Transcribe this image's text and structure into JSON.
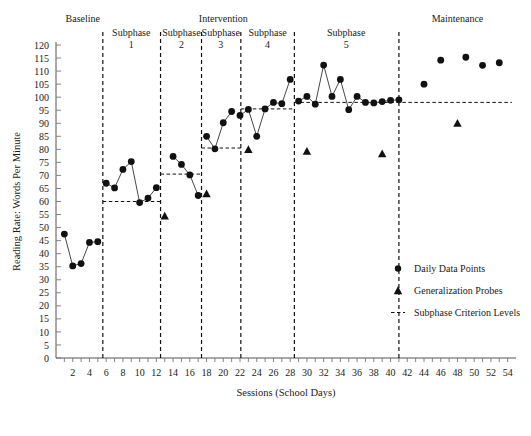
{
  "chart_data": {
    "type": "line",
    "title": "",
    "xlabel": "Sessions (School Days)",
    "ylabel": "Reading Rate: Words Per Minute",
    "xlim": [
      0,
      55
    ],
    "ylim": [
      0,
      120
    ],
    "ytick_step": 5,
    "yticks": [
      0,
      5,
      10,
      15,
      20,
      25,
      30,
      35,
      40,
      45,
      50,
      55,
      60,
      65,
      70,
      75,
      80,
      85,
      90,
      95,
      100,
      105,
      110,
      115,
      120
    ],
    "xticks": [
      2,
      4,
      6,
      8,
      10,
      12,
      14,
      16,
      18,
      20,
      22,
      24,
      26,
      28,
      30,
      32,
      34,
      36,
      38,
      40,
      42,
      44,
      46,
      48,
      50,
      52,
      54
    ],
    "grid": false,
    "legend_position": "inside-right",
    "series": [
      {
        "name": "Daily Data Points",
        "marker": "circle",
        "connected": true,
        "segments": [
          {
            "phase": "Baseline",
            "x": [
              1,
              2,
              3,
              4,
              5
            ],
            "y": [
              47.5,
              35.3,
              36.2,
              44.3,
              44.6
            ]
          },
          {
            "phase": "Subphase 1",
            "x": [
              6,
              7,
              8,
              9,
              10,
              11,
              12
            ],
            "y": [
              67.0,
              65.2,
              72.3,
              75.3,
              59.6,
              61.3,
              65.3
            ]
          },
          {
            "phase": "Subphase 2",
            "x": [
              14,
              15,
              16,
              17
            ],
            "y": [
              77.3,
              74.2,
              70.2,
              62.3
            ]
          },
          {
            "phase": "Subphase 3",
            "x": [
              18,
              19,
              20,
              21
            ],
            "y": [
              85.0,
              80.2,
              90.2,
              94.5
            ]
          },
          {
            "phase": "Subphase 4",
            "x": [
              22,
              23,
              24,
              25,
              26,
              27,
              28
            ],
            "y": [
              93.0,
              95.3,
              85.0,
              95.5,
              98.0,
              97.5,
              106.8
            ]
          },
          {
            "phase": "Subphase 5",
            "x": [
              29,
              30,
              31,
              32,
              33,
              34,
              35,
              36,
              37,
              38,
              39,
              40,
              41
            ],
            "y": [
              98.5,
              100.3,
              97.3,
              112.3,
              100.3,
              106.8,
              95.2,
              100.3,
              98.0,
              97.8,
              98.3,
              98.8,
              99.0
            ]
          },
          {
            "phase": "Maintenance",
            "x": [
              44,
              46,
              49,
              51,
              53
            ],
            "y": [
              105.0,
              114.2,
              115.3,
              112.2,
              113.2
            ],
            "connected": false
          }
        ]
      },
      {
        "name": "Generalization Probes",
        "marker": "triangle",
        "connected": false,
        "x": [
          13,
          18,
          23,
          30,
          39,
          48
        ],
        "y": [
          54.5,
          63.0,
          80.0,
          79.3,
          78.3,
          90.0
        ]
      }
    ],
    "criterion_levels": [
      {
        "phase": "Subphase 1",
        "value": 60.0,
        "x_start": 5.6,
        "x_end": 12.5
      },
      {
        "phase": "Subphase 2",
        "value": 70.5,
        "x_start": 12.5,
        "x_end": 17.4
      },
      {
        "phase": "Subphase 3",
        "value": 80.5,
        "x_start": 17.4,
        "x_end": 22.1
      },
      {
        "phase": "Subphase 4",
        "value": 95.5,
        "x_start": 22.1,
        "x_end": 28.5
      },
      {
        "phase": "Subphase 5",
        "value": 98.0,
        "x_start": 28.5,
        "x_end": 54.5
      }
    ],
    "phase_dividers": [
      5.6,
      12.5,
      17.4,
      22.1,
      28.5,
      41.0
    ],
    "phase_headers": [
      {
        "label": "Baseline",
        "sublabel": "",
        "center_x": 3.2
      },
      {
        "label": "Intervention",
        "sublabel": "",
        "center_x": 20.0
      },
      {
        "label": "Maintenance",
        "sublabel": "",
        "center_x": 48.0
      }
    ],
    "subphase_headers": [
      {
        "label": "Subphase",
        "number": "1",
        "center_x": 9.0
      },
      {
        "label": "Subphase",
        "number": "2",
        "center_x": 15.0
      },
      {
        "label": "Subphase",
        "number": "3",
        "center_x": 19.7
      },
      {
        "label": "Subphase",
        "number": "4",
        "center_x": 25.3
      },
      {
        "label": "Subphase",
        "number": "5",
        "center_x": 34.7
      }
    ],
    "legend_entries": [
      {
        "marker": "circle",
        "label": "Daily Data Points"
      },
      {
        "marker": "triangle",
        "label": "Generalization Probes"
      },
      {
        "marker": "dashed-line",
        "label": "Subphase Criterion Levels"
      }
    ],
    "colors": {
      "marker": "#111111",
      "line": "#333333",
      "axis": "#555555",
      "divider": "#111111"
    }
  }
}
